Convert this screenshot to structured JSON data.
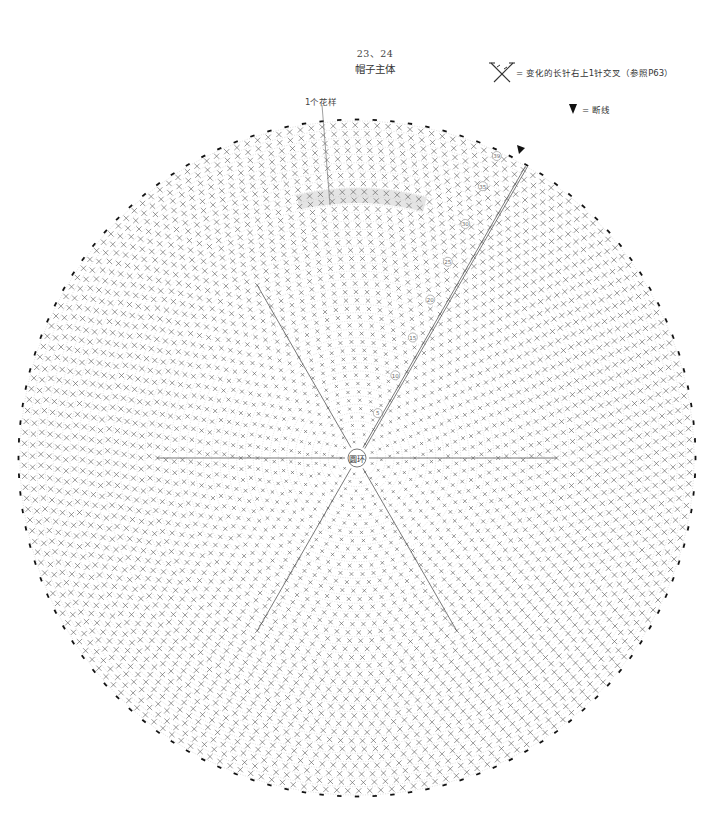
{
  "title": {
    "number": "23、24",
    "name": "帽子主体"
  },
  "legend": [
    {
      "icon": "crossed-double-crochet-symbol",
      "text": "= 变化的长针右上1针交叉（参照P63）"
    },
    {
      "icon": "cut-yarn-triangle",
      "text": "= 断线"
    }
  ],
  "annotations": {
    "pattern_repeat": "1个花样",
    "center_ring": "圆环"
  },
  "diagram": {
    "type": "crochet-round-chart",
    "rows_total": 39,
    "sectors": 6,
    "row_markers": [
      "5",
      "10",
      "15",
      "20",
      "25",
      "30",
      "35",
      "39"
    ],
    "colors": {
      "stitch": "#555555",
      "row_guide": "#bbbbbb",
      "highlight": "#e4e4e4",
      "edge_mark": "#111111"
    }
  }
}
